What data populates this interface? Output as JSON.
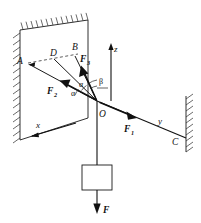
{
  "figure": {
    "kind": "physics-force-diagram",
    "background_color": "#ffffff",
    "ink_color": "#111111"
  },
  "points": {
    "A": "A",
    "B": "B",
    "C": "C",
    "D": "D",
    "O": "O"
  },
  "axes": [
    {
      "name": "x-axis",
      "label": "x"
    },
    {
      "name": "y-axis",
      "label": "y"
    },
    {
      "name": "z-axis",
      "label": "z"
    }
  ],
  "forces": [
    {
      "name": "F1",
      "base": "F",
      "subscript": "1"
    },
    {
      "name": "F2",
      "base": "F",
      "subscript": "2"
    },
    {
      "name": "F3",
      "base": "F",
      "subscript": "3"
    },
    {
      "name": "F",
      "base": "F",
      "subscript": ""
    }
  ],
  "angles": [
    {
      "name": "alpha-lower",
      "label": "α"
    },
    {
      "name": "alpha-upper",
      "label": "α"
    },
    {
      "name": "beta",
      "label": "β"
    }
  ],
  "elements": {
    "wall_left": "hatched-wall-panel",
    "wall_right": "hatched-wall-line",
    "block": "suspended-block",
    "cable": "suspension-cable"
  }
}
